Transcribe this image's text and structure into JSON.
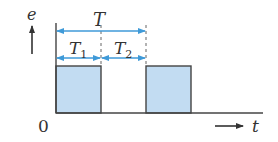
{
  "diagram": {
    "type": "pulse-waveform",
    "y_axis_label": "e",
    "x_axis_label": "t",
    "origin_label": "0",
    "period_label": "T",
    "on_time_label": "T",
    "on_time_sub": "1",
    "off_time_label": "T",
    "off_time_sub": "2",
    "colors": {
      "pulse_fill": "#c2dcf2",
      "outline": "#444444",
      "dimension_arrows": "#3f9ad8"
    },
    "pulses": [
      {
        "start": "0",
        "end": "T1"
      },
      {
        "start": "T",
        "end": "T+T1"
      }
    ]
  }
}
